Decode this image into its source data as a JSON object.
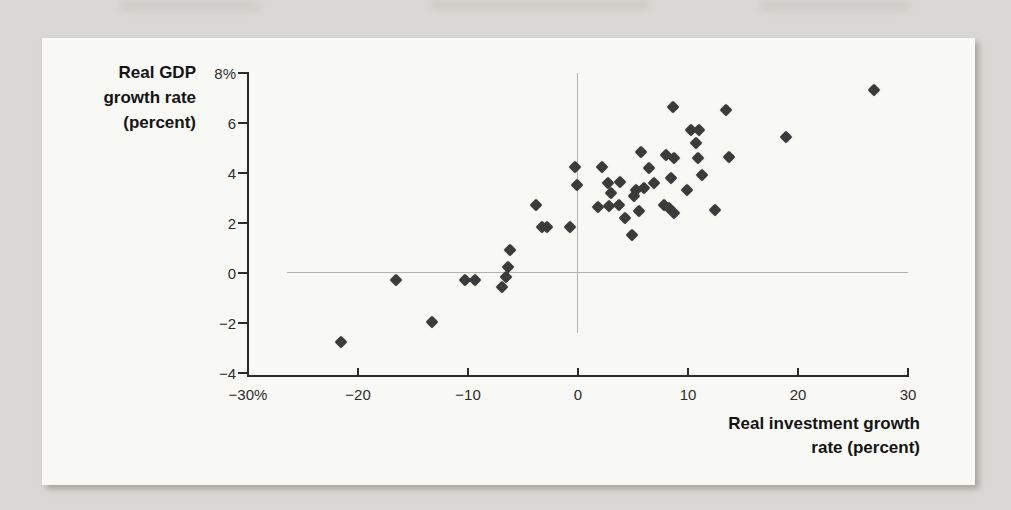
{
  "figure": {
    "y_axis_title_lines": [
      "Real GDP",
      "growth rate",
      "(percent)"
    ],
    "x_axis_title_lines": [
      "Real investment growth",
      "rate (percent)"
    ]
  },
  "colors": {
    "page_background": "#d9d8d4",
    "panel_background": "#f8f8f4",
    "axis": "#2b2b2b",
    "zero_line": "#b2b2ae",
    "marker": "#3b3b3b",
    "text": "#141414"
  },
  "chart_data": {
    "type": "scatter",
    "title": "",
    "xlabel": "Real investment growth rate (percent)",
    "ylabel": "Real GDP growth rate (percent)",
    "xlim": [
      -30,
      30
    ],
    "ylim": [
      -4,
      8
    ],
    "x_ticks": [
      -30,
      -20,
      -10,
      0,
      10,
      20,
      30
    ],
    "x_tick_labels": [
      "−30%",
      "−20",
      "−10",
      "0",
      "10",
      "20",
      "30"
    ],
    "y_ticks": [
      8,
      6,
      4,
      2,
      0,
      -2,
      -4
    ],
    "y_tick_labels": [
      "8%",
      "6",
      "4",
      "2",
      "0",
      "−2",
      "−4"
    ],
    "grid": "zero-lines-only",
    "legend": "none",
    "marker": "diamond",
    "points": [
      [
        -21.5,
        -2.8
      ],
      [
        -16.5,
        -0.3
      ],
      [
        -13.2,
        -2.0
      ],
      [
        -10.2,
        -0.3
      ],
      [
        -9.3,
        -0.3
      ],
      [
        -6.8,
        -0.6
      ],
      [
        -6.5,
        -0.2
      ],
      [
        -6.3,
        0.2
      ],
      [
        -6.1,
        0.9
      ],
      [
        -3.7,
        2.7
      ],
      [
        -3.2,
        1.8
      ],
      [
        -2.7,
        1.8
      ],
      [
        -0.6,
        1.8
      ],
      [
        -0.2,
        4.2
      ],
      [
        0.0,
        3.5
      ],
      [
        1.9,
        2.6
      ],
      [
        2.3,
        4.2
      ],
      [
        2.8,
        3.55
      ],
      [
        2.9,
        2.65
      ],
      [
        3.1,
        3.15
      ],
      [
        3.85,
        2.7
      ],
      [
        3.9,
        3.6
      ],
      [
        4.4,
        2.15
      ],
      [
        5.0,
        1.5
      ],
      [
        5.2,
        3.05
      ],
      [
        5.4,
        3.3
      ],
      [
        5.6,
        2.45
      ],
      [
        5.8,
        4.8
      ],
      [
        6.1,
        3.35
      ],
      [
        6.5,
        4.15
      ],
      [
        7.0,
        3.55
      ],
      [
        7.9,
        2.7
      ],
      [
        8.4,
        2.55
      ],
      [
        8.8,
        2.35
      ],
      [
        8.1,
        4.7
      ],
      [
        8.5,
        3.75
      ],
      [
        8.7,
        6.6
      ],
      [
        8.8,
        4.55
      ],
      [
        10.0,
        3.3
      ],
      [
        10.4,
        5.7
      ],
      [
        10.8,
        5.15
      ],
      [
        11.0,
        4.55
      ],
      [
        11.1,
        5.7
      ],
      [
        11.4,
        3.9
      ],
      [
        12.5,
        2.5
      ],
      [
        13.5,
        6.5
      ],
      [
        13.8,
        4.6
      ],
      [
        19.0,
        5.4
      ],
      [
        27.0,
        7.3
      ]
    ]
  }
}
